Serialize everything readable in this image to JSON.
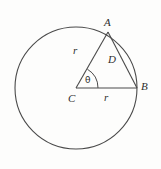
{
  "figure": {
    "background_color": "#fdfdfc",
    "stroke_color": "#4a4a4a",
    "text_color": "#2e2e2e",
    "labels": {
      "point_a": "A",
      "point_b": "B",
      "center_c": "C",
      "chord_d": "D",
      "radius_upper": "r",
      "radius_lower": "r",
      "angle_theta": "θ"
    },
    "geometry": {
      "circle": {
        "cx": 76,
        "cy": 88,
        "r": 61
      },
      "point_a": {
        "x": 108,
        "y": 32
      },
      "point_b": {
        "x": 137,
        "y": 88
      },
      "point_c": {
        "x": 76,
        "y": 88
      },
      "angle_arc_radius": 22,
      "segments": [
        {
          "name": "radius-ca",
          "from": "C",
          "to": "A",
          "label": "r"
        },
        {
          "name": "radius-cb",
          "from": "C",
          "to": "B",
          "label": "r"
        },
        {
          "name": "chord-ab",
          "from": "A",
          "to": "B",
          "label": "D"
        }
      ]
    }
  }
}
